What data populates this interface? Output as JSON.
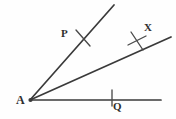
{
  "figure": {
    "type": "geometry-diagram",
    "background_color": "#fefefe",
    "stroke_color": "#3a3a3a",
    "tick_color": "#4a4a4a",
    "label_color": "#2e2e2e",
    "canvas": {
      "width": 176,
      "height": 119
    },
    "vertex": {
      "name": "A",
      "label": "A",
      "x": 30,
      "y": 100
    },
    "points": [
      {
        "name": "P",
        "label": "P",
        "x": 68,
        "y": 33
      },
      {
        "name": "X",
        "label": "X",
        "x": 149,
        "y": 28
      },
      {
        "name": "Q",
        "label": "Q",
        "x": 117,
        "y": 107
      }
    ],
    "rays": [
      {
        "name": "ray-AP-upper",
        "from": [
          30,
          100
        ],
        "to": [
          114,
          5
        ],
        "through_label": "P"
      },
      {
        "name": "ray-AX-middle",
        "from": [
          30,
          100
        ],
        "to": [
          171,
          37
        ],
        "through_label": "X"
      },
      {
        "name": "ray-AQ-horizontal",
        "from": [
          30,
          100
        ],
        "to": [
          161,
          100
        ],
        "through_label": "Q"
      }
    ],
    "arc_marks": [
      {
        "name": "tick-at-P",
        "on_ray": "ray-AP-upper",
        "cx": 83,
        "cy": 38,
        "strokes": 1
      },
      {
        "name": "tick-at-X",
        "on_ray": "ray-AX-middle",
        "cx": 137,
        "cy": 41,
        "strokes": 2
      },
      {
        "name": "tick-at-Q",
        "on_ray": "ray-AQ-horizontal",
        "cx": 112,
        "cy": 100,
        "strokes": 1
      }
    ]
  }
}
